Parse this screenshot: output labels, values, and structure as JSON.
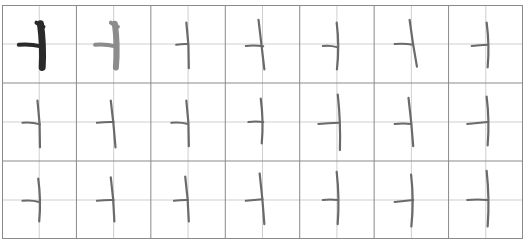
{
  "sheet": {
    "type": "calligraphy-practice-grid",
    "rows": 3,
    "cols": 7,
    "grid_style": "cross-guideline (田字格 half lines)",
    "colors": {
      "background": "#ffffff",
      "major_line": "#8a8a8a",
      "minor_line": "#cfcfcf",
      "model_stroke": "#2a2a2a",
      "trace_stroke": "#8c8c8c",
      "practice_stroke": "#6a6a6a"
    },
    "character": "亅-like stroke (horizontal + vertical)",
    "cells": [
      {
        "row": 0,
        "col": 0,
        "kind": "model",
        "h": [
          -0.55,
          0.02,
          0.05,
          0.06
        ],
        "v": [
          0.06,
          -0.52,
          0.08,
          0.6
        ],
        "hook": true
      },
      {
        "row": 0,
        "col": 1,
        "kind": "trace",
        "h": [
          -0.5,
          0.02,
          0.05,
          0.06
        ],
        "v": [
          0.06,
          -0.52,
          0.06,
          0.6
        ],
        "hook": true
      },
      {
        "row": 0,
        "col": 2,
        "kind": "practice",
        "h": [
          -0.32,
          0.02,
          0.0,
          0.0
        ],
        "v": [
          -0.02,
          -0.55,
          0.02,
          0.62
        ]
      },
      {
        "row": 0,
        "col": 3,
        "kind": "practice",
        "h": [
          -0.45,
          0.05,
          0.02,
          0.06
        ],
        "v": [
          -0.08,
          -0.62,
          0.05,
          0.65
        ]
      },
      {
        "row": 0,
        "col": 4,
        "kind": "practice",
        "h": [
          -0.38,
          0.05,
          0.0,
          0.08
        ],
        "v": [
          0.02,
          -0.55,
          0.0,
          0.65
        ]
      },
      {
        "row": 0,
        "col": 5,
        "kind": "practice",
        "h": [
          -0.45,
          0.0,
          0.05,
          0.02
        ],
        "v": [
          -0.02,
          -0.62,
          0.15,
          0.58
        ]
      },
      {
        "row": 0,
        "col": 6,
        "kind": "practice",
        "h": [
          -0.38,
          0.05,
          0.05,
          0.02
        ],
        "v": [
          0.05,
          -0.55,
          0.05,
          0.6
        ]
      },
      {
        "row": 1,
        "col": 0,
        "kind": "practice",
        "h": [
          -0.45,
          0.02,
          0.02,
          0.06
        ],
        "v": [
          -0.02,
          -0.55,
          0.02,
          0.65
        ]
      },
      {
        "row": 1,
        "col": 1,
        "kind": "practice",
        "h": [
          -0.45,
          0.02,
          0.0,
          0.0
        ],
        "v": [
          -0.05,
          -0.55,
          0.05,
          0.65
        ]
      },
      {
        "row": 1,
        "col": 2,
        "kind": "practice",
        "h": [
          -0.45,
          0.02,
          0.0,
          0.05
        ],
        "v": [
          -0.02,
          -0.55,
          0.02,
          0.62
        ]
      },
      {
        "row": 1,
        "col": 3,
        "kind": "practice",
        "h": [
          -0.38,
          0.0,
          0.02,
          0.0
        ],
        "v": [
          -0.02,
          -0.6,
          -0.02,
          0.55
        ]
      },
      {
        "row": 1,
        "col": 4,
        "kind": "practice",
        "h": [
          -0.5,
          0.05,
          0.05,
          0.02
        ],
        "v": [
          0.05,
          -0.7,
          0.08,
          0.72
        ]
      },
      {
        "row": 1,
        "col": 5,
        "kind": "practice",
        "h": [
          -0.45,
          0.05,
          0.0,
          0.05
        ],
        "v": [
          -0.05,
          -0.62,
          0.05,
          0.62
        ]
      },
      {
        "row": 1,
        "col": 6,
        "kind": "practice",
        "h": [
          -0.5,
          0.05,
          0.05,
          0.0
        ],
        "v": [
          0.05,
          -0.65,
          0.05,
          0.6
        ]
      },
      {
        "row": 2,
        "col": 0,
        "kind": "practice",
        "h": [
          -0.45,
          0.02,
          0.0,
          0.05
        ],
        "v": [
          0.0,
          -0.55,
          0.0,
          0.55
        ]
      },
      {
        "row": 2,
        "col": 1,
        "kind": "practice",
        "h": [
          -0.45,
          0.02,
          0.0,
          0.0
        ],
        "v": [
          -0.05,
          -0.58,
          0.02,
          0.55
        ]
      },
      {
        "row": 2,
        "col": 2,
        "kind": "practice",
        "h": [
          -0.38,
          0.02,
          0.0,
          0.0
        ],
        "v": [
          -0.05,
          -0.6,
          0.02,
          0.55
        ]
      },
      {
        "row": 2,
        "col": 3,
        "kind": "practice",
        "h": [
          -0.45,
          0.02,
          0.0,
          -0.02
        ],
        "v": [
          -0.05,
          -0.68,
          0.05,
          0.62
        ]
      },
      {
        "row": 2,
        "col": 4,
        "kind": "practice",
        "h": [
          -0.38,
          0.0,
          0.02,
          0.0
        ],
        "v": [
          0.02,
          -0.72,
          0.02,
          0.62
        ]
      },
      {
        "row": 2,
        "col": 5,
        "kind": "practice",
        "h": [
          -0.45,
          0.05,
          0.05,
          0.0
        ],
        "v": [
          0.02,
          -0.65,
          0.0,
          0.68
        ]
      },
      {
        "row": 2,
        "col": 6,
        "kind": "practice",
        "h": [
          -0.5,
          0.0,
          0.05,
          0.0
        ],
        "v": [
          0.05,
          -0.75,
          0.05,
          0.68
        ]
      }
    ]
  }
}
